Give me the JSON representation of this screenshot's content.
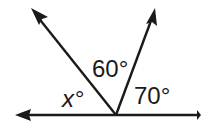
{
  "diagram": {
    "type": "angle-figure",
    "stroke_color": "#1a1a1a",
    "background": "#ffffff",
    "vertex": {
      "x": 116,
      "y": 115
    },
    "lines": [
      {
        "name": "horizontal-line",
        "from": [
          15,
          115
        ],
        "to": [
          200,
          115
        ],
        "arrow_left": true,
        "arrow_right": true
      },
      {
        "name": "left-ray",
        "from": [
          116,
          115
        ],
        "to": [
          31,
          8
        ],
        "arrow_end": true
      },
      {
        "name": "right-ray",
        "from": [
          116,
          115
        ],
        "to": [
          155,
          8
        ],
        "arrow_end": true
      }
    ],
    "labels": {
      "angle_x": "x°",
      "angle_60": "60°",
      "angle_70": "70°"
    }
  }
}
